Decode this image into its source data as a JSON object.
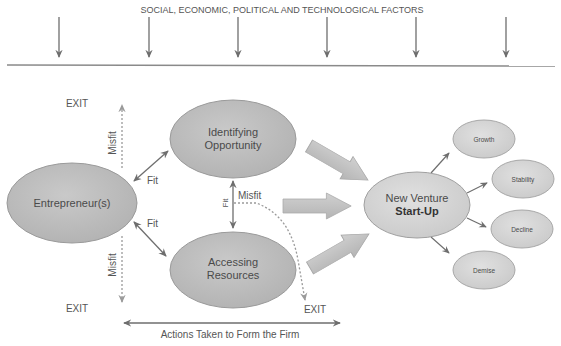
{
  "header": {
    "title": "SOCIAL, ECONOMIC, POLITICAL AND TECHNOLOGICAL FACTORS",
    "factor_arrow_count": 6
  },
  "nodes": {
    "entrepreneur": "Entrepreneur(s)",
    "identifying_line1": "Identifying",
    "identifying_line2": "Opportunity",
    "accessing_line1": "Accessing",
    "accessing_line2": "Resources",
    "venture_line1": "New Venture",
    "venture_line2": "Start-Up"
  },
  "outcomes": [
    "Growth",
    "Stability",
    "Decline",
    "Demise"
  ],
  "labels": {
    "exit_top_left": "EXIT",
    "exit_bottom_left": "EXIT",
    "exit_bottom_middle": "EXIT",
    "misfit_upper": "Misfit",
    "misfit_lower": "Misfit",
    "misfit_middle": "Misfit",
    "fit_upper": "Fit",
    "fit_lower": "Fit",
    "fit_middle": "Fit",
    "actions": "Actions Taken to Form the Firm"
  },
  "colors": {
    "node_fill": "#bdbdbd",
    "outcome_fill": "#d6d6d6",
    "arrow_line": "#6e6e6e",
    "dotted_line": "#9a9a9a",
    "block_arrow": "#c2c2c2"
  }
}
